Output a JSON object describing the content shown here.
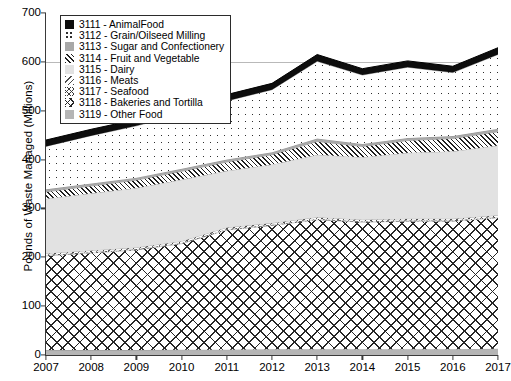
{
  "axes": {
    "ylabel": "Pounds of Waste Managed (Millions)",
    "xlabel": "",
    "yticks": [
      "0",
      "100",
      "200",
      "300",
      "400",
      "500",
      "600",
      "700"
    ],
    "xticks": [
      "2007",
      "2008",
      "2009",
      "2010",
      "2011",
      "2012",
      "2013",
      "2014",
      "2015",
      "2016",
      "2017"
    ]
  },
  "legend": {
    "items": [
      {
        "label": "3111 - AnimalFood",
        "icon": "swatch-solid-black",
        "pattern": "p-animalfood"
      },
      {
        "label": "3112 - Grain/Oilseed Milling",
        "icon": "swatch-dotted",
        "pattern": "p-grain"
      },
      {
        "label": "3113 - Sugar and Confectionery",
        "icon": "swatch-grey",
        "pattern": "p-sugar"
      },
      {
        "label": "3114 - Fruit and Vegetable",
        "icon": "swatch-diagonal-hatch",
        "pattern": "p-fruitveg"
      },
      {
        "label": "3115 - Dairy",
        "icon": "swatch-light-grey",
        "pattern": "p-dairy"
      },
      {
        "label": "3116 - Meats",
        "icon": "swatch-back-hatch",
        "pattern": "p-meats"
      },
      {
        "label": "3117 - Seafood",
        "icon": "swatch-fine-cross",
        "pattern": "p-seafood"
      },
      {
        "label": "3118 - Bakeries and Tortilla",
        "icon": "swatch-crosshatch",
        "pattern": "p-bakeries"
      },
      {
        "label": "3119 - Other Food",
        "icon": "swatch-mid-grey",
        "pattern": "p-otherfood"
      }
    ]
  },
  "chart_data": {
    "type": "area",
    "stacked": true,
    "title": "",
    "xlabel": "",
    "ylabel": "Pounds of Waste Managed (Millions)",
    "x": [
      2007,
      2008,
      2009,
      2010,
      2011,
      2012,
      2013,
      2014,
      2015,
      2016,
      2017
    ],
    "ylim": [
      0,
      700
    ],
    "ytick_step": 100,
    "grid": "horizontal-at-600-only",
    "legend_position": "upper-left-inside",
    "stack_order_bottom_to_top": [
      "3119 - Other Food",
      "3118 - Bakeries and Tortilla",
      "3117 - Seafood",
      "3116 - Meats",
      "3115 - Dairy",
      "3114 - Fruit and Vegetable",
      "3113 - Sugar and Confectionery",
      "3112 - Grain/Oilseed Milling",
      "3111 - AnimalFood"
    ],
    "series": [
      {
        "name": "3119 - Other Food",
        "values": [
          10,
          10,
          10,
          11,
          11,
          12,
          12,
          12,
          12,
          12,
          13
        ]
      },
      {
        "name": "3118 - Bakeries and Tortilla",
        "values": [
          193,
          199,
          205,
          217,
          245,
          253,
          265,
          260,
          262,
          262,
          268
        ]
      },
      {
        "name": "3117 - Seafood",
        "values": [
          2,
          2,
          2,
          2,
          2,
          2,
          2,
          2,
          2,
          2,
          2
        ]
      },
      {
        "name": "3116 - Meats",
        "values": [
          3,
          3,
          3,
          3,
          3,
          3,
          3,
          3,
          3,
          3,
          3
        ]
      },
      {
        "name": "3115 - Dairy",
        "values": [
          112,
          117,
          122,
          126,
          116,
          120,
          128,
          128,
          135,
          138,
          143
        ]
      },
      {
        "name": "3114 - Fruit and Vegetable",
        "values": [
          14,
          15,
          16,
          17,
          18,
          20,
          27,
          22,
          25,
          26,
          28
        ]
      },
      {
        "name": "3113 - Sugar and Confectionery",
        "values": [
          5,
          5,
          5,
          5,
          5,
          5,
          6,
          5,
          5,
          5,
          6
        ]
      },
      {
        "name": "3112 - Grain/Oilseed Milling",
        "values": [
          88,
          98,
          106,
          112,
          120,
          128,
          158,
          141,
          145,
          130,
          152
        ]
      },
      {
        "name": "3111 - AnimalFood",
        "values": [
          13,
          13,
          13,
          13,
          13,
          13,
          14,
          13,
          13,
          13,
          14
        ]
      }
    ],
    "totals": [
      440,
      462,
      482,
      506,
      533,
      556,
      615,
      586,
      602,
      591,
      629
    ]
  }
}
